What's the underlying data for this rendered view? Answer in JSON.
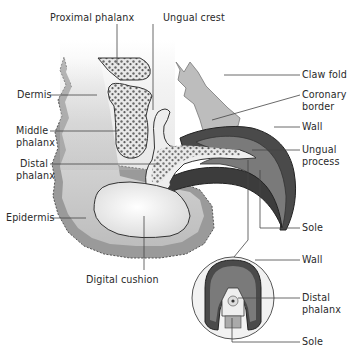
{
  "diagram": {
    "labels": {
      "proximal_phalanx": "Proximal phalanx",
      "ungual_crest": "Ungual crest",
      "dermis": "Dermis",
      "claw_fold": "Claw fold",
      "coronary_border_1": "Coronary",
      "coronary_border_2": "border",
      "wall": "Wall",
      "middle_phalanx_1": "Middle",
      "middle_phalanx_2": "phalanx",
      "distal_phalanx_1": "Distal",
      "distal_phalanx_2": "phalanx",
      "ungual_process_1": "Ungual",
      "ungual_process_2": "process",
      "epidermis": "Epidermis",
      "sole": "Sole",
      "digital_cushion": "Digital cushion"
    },
    "cross_section": {
      "wall": "Wall",
      "distal_phalanx_1": "Distal",
      "distal_phalanx_2": "phalanx",
      "sole": "Sole"
    },
    "colors": {
      "dark_horn": "#4a4a4a",
      "mid_horn": "#7a7a7a",
      "epidermis": "#9a9a9a",
      "dermis": "#cfcfcf",
      "bone": "#e6e6e6",
      "cushion": "#f4f4f4",
      "line": "#333333"
    }
  }
}
